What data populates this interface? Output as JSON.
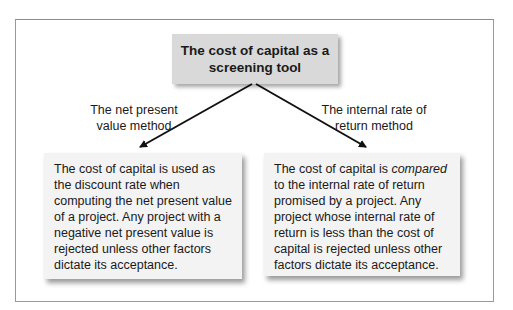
{
  "diagram": {
    "title": "The cost of capital as a screening tool",
    "branches": [
      {
        "label": "The net present value method",
        "label_lines": [
          "The net present",
          "value method"
        ],
        "description": "The cost of capital is used as the discount rate when computing the net present value of a project. Any project with a negative net present value is rejected unless other factors dictate its acceptance."
      },
      {
        "label": "The internal rate of return method",
        "label_lines": [
          "The internal rate of",
          "return method"
        ],
        "description_before": "The cost of capital is ",
        "description_emphasis": "compared",
        "description_after": " to the internal rate of return promised by a project. Any project whose internal rate of return is less than the cost of capital is rejected unless other factors dictate its acceptance."
      }
    ],
    "colors": {
      "title_box": "#d9d9d9",
      "content_box": "#f3f3f3",
      "frame": "#9a9a9a",
      "arrow": "#111111"
    }
  }
}
